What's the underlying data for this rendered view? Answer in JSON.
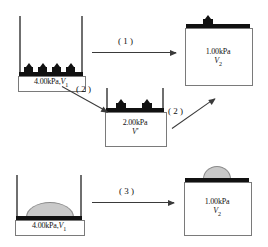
{
  "diagram": {
    "states": {
      "initial_top": {
        "name": "initial-state-with-weights",
        "pressure": "4.00kPa,",
        "volume": "V",
        "volume_sub": "1",
        "weights": 4,
        "weight_style": "discrete-blocks"
      },
      "intermediate": {
        "name": "intermediate-state",
        "pressure": "2.00kPa",
        "volume": "V'",
        "volume_sub": "",
        "weights": 2,
        "weight_style": "discrete-blocks"
      },
      "final_top": {
        "name": "final-state-top",
        "pressure": "1.00kPa",
        "volume": "V",
        "volume_sub": "2",
        "weights": 1,
        "weight_style": "discrete-blocks"
      },
      "initial_bottom": {
        "name": "initial-state-with-sand",
        "pressure": "4.00kPa,",
        "volume": "V",
        "volume_sub": "1",
        "weights": 0,
        "weight_style": "sand-mound"
      },
      "final_bottom": {
        "name": "final-state-bottom",
        "pressure": "1.00kPa",
        "volume": "V",
        "volume_sub": "2",
        "weights": 0,
        "weight_style": "sand-mound"
      }
    },
    "arrows": [
      {
        "id": "1",
        "label": "( 1 )",
        "from": "initial_top",
        "to": "final_top"
      },
      {
        "id": "2a",
        "label": "( 2 )",
        "from": "initial_top",
        "to": "intermediate"
      },
      {
        "id": "2b",
        "label": "( 2 )",
        "from": "intermediate",
        "to": "final_top"
      },
      {
        "id": "3",
        "label": "( 3 )",
        "from": "initial_bottom",
        "to": "final_bottom"
      }
    ],
    "colors": {
      "piston": "#111111",
      "wall": "#6f6f6f",
      "box_border": "#7a7a7a",
      "sand": "#c9c9c9",
      "arrow": "#3a3a3a"
    }
  }
}
